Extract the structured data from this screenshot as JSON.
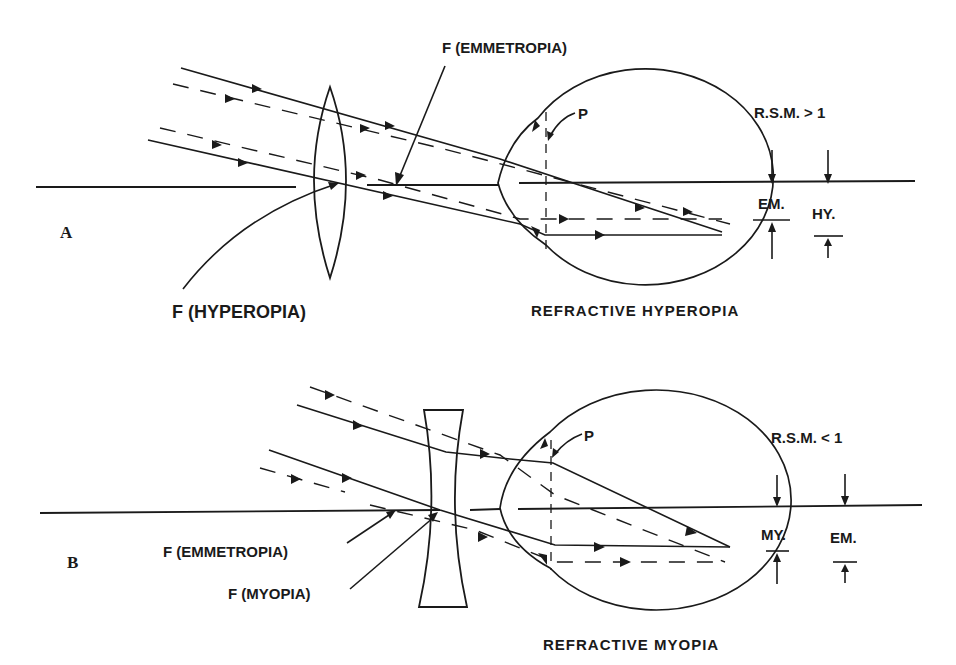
{
  "figure": {
    "panel_a": {
      "letter": "A",
      "title": "REFRACTIVE HYPEROPIA",
      "focal_emmetropia_label": "F (EMMETROPIA)",
      "focal_hyperopia_label": "F (HYPEROPIA)",
      "principal_plane_label": "P",
      "rsm_label": "R.S.M. > 1",
      "dimension_labels": [
        "EM.",
        "HY."
      ],
      "lens_type": "convex"
    },
    "panel_b": {
      "letter": "B",
      "title": "REFRACTIVE MYOPIA",
      "focal_emmetropia_label": "F (EMMETROPIA)",
      "focal_myopia_label": "F (MYOPIA)",
      "principal_plane_label": "P",
      "rsm_label": "R.S.M. < 1",
      "dimension_labels": [
        "MY.",
        "EM."
      ],
      "lens_type": "concave"
    },
    "colors": {
      "ink": "#1a1a1a",
      "background": "#ffffff"
    }
  }
}
